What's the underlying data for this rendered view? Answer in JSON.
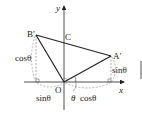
{
  "diagram": {
    "type": "rotation-geometry",
    "axes": {
      "x_label": "x",
      "y_label": "y",
      "origin_label": "O"
    },
    "points": {
      "B_prime": {
        "label": "B′",
        "x": 36,
        "y": 35
      },
      "C": {
        "label": "C",
        "x": 63,
        "y": 42
      },
      "A_prime": {
        "label": "A′",
        "x": 111,
        "y": 56
      },
      "O": {
        "label": "O",
        "x": 64,
        "y": 82
      }
    },
    "labels": {
      "cos_left": "cosθ",
      "sin_right": "sinθ",
      "sin_bottom": "sinθ",
      "theta": "θ",
      "cos_bottom": "cosθ"
    },
    "colors": {
      "line": "#222222",
      "dashed": "#888888",
      "bar": "#555555"
    }
  }
}
